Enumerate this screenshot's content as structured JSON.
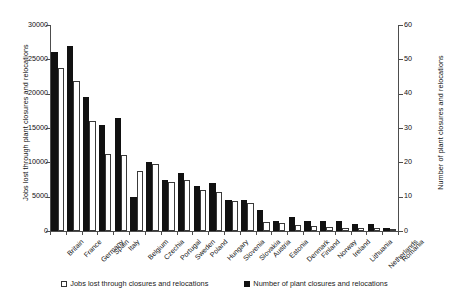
{
  "chart_data": {
    "type": "bar",
    "title": "",
    "subtitle": "",
    "xlabel": "",
    "ylabel": "Jobs lost through plant closures and relocations",
    "y2label": "Number of plant closures and relocations",
    "ylim": [
      0,
      30000
    ],
    "y2lim": [
      0,
      60
    ],
    "yticks": [
      "0",
      "5000",
      "10000",
      "15000",
      "20000",
      "25000",
      "30000"
    ],
    "y2ticks": [
      "0",
      "10",
      "20",
      "30",
      "40",
      "50",
      "60"
    ],
    "grid": false,
    "legend_position": "bottom",
    "categories": [
      "Britain",
      "France",
      "Germany",
      "Spain",
      "Italy",
      "Belgium",
      "Czechia",
      "Portugal",
      "Sweden",
      "Poland",
      "Hungary",
      "Slovenia",
      "Slovakia",
      "Austria",
      "Estonia",
      "Denmark",
      "Finland",
      "Norway",
      "Ireland",
      "Lithuania",
      "Netherlands",
      "Romania"
    ],
    "series": [
      {
        "name": "Jobs lost through closures and relocations",
        "axis": "left",
        "style": "open",
        "values": [
          23800,
          21800,
          16000,
          11200,
          11100,
          8700,
          9800,
          7200,
          7500,
          6000,
          5700,
          4400,
          4100,
          1300,
          1100,
          900,
          700,
          600,
          500,
          450,
          400,
          200
        ]
      },
      {
        "name": "Number of plant closures and relocations",
        "axis": "right",
        "style": "filled",
        "values": [
          52,
          54,
          39,
          31,
          33,
          10,
          20,
          15,
          17,
          13,
          14,
          9,
          9,
          6,
          3,
          4,
          3,
          3,
          3,
          2,
          2,
          1
        ]
      }
    ]
  },
  "legend": {
    "items": [
      {
        "label": "Jobs lost through closures and relocations",
        "swatch": "open-square-icon"
      },
      {
        "label": "Number of plant closures and relocations",
        "swatch": "filled-square-icon"
      }
    ]
  }
}
